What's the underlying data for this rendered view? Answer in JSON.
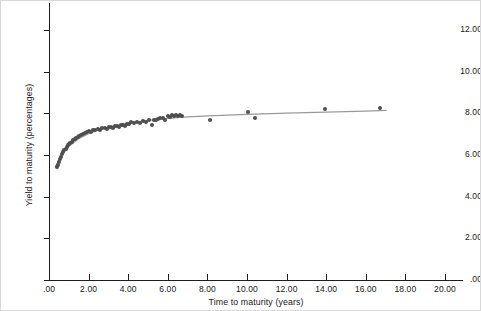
{
  "chart_data": {
    "type": "scatter",
    "title": "",
    "subtitle": "",
    "xlabel": "Time to maturity (years)",
    "ylabel": "Yield to maturity (percentages)",
    "xlim": [
      0,
      21
    ],
    "ylim": [
      0,
      13.3
    ],
    "grid": false,
    "legend": "none",
    "x_ticks": [
      ".00",
      "2.00",
      "4.00",
      "6.00",
      "8.00",
      "10.00",
      "12.00",
      "14.00",
      "16.00",
      "18.00",
      "20.00"
    ],
    "x_tick_values": [
      0,
      2,
      4,
      6,
      8,
      10,
      12,
      14,
      16,
      18,
      20
    ],
    "y_ticks": [
      ".00",
      "2.00",
      "4.00",
      "6.00",
      "8.00",
      "10.00",
      "12.00"
    ],
    "y_tick_values": [
      0,
      2,
      4,
      6,
      8,
      10,
      12
    ],
    "marker_color": "#4e4e4e",
    "line_color": "#9a9a9a",
    "axis_color": "#1d1d1d",
    "background_color": "#ffffff",
    "series": [
      {
        "name": "Observed bonds",
        "type": "scatter",
        "x": [
          0.42,
          0.45,
          0.5,
          0.55,
          0.6,
          0.66,
          0.72,
          0.78,
          0.84,
          0.9,
          0.96,
          1.02,
          1.08,
          1.15,
          1.22,
          1.3,
          1.38,
          1.46,
          1.54,
          1.62,
          1.7,
          1.8,
          1.9,
          2.0,
          2.1,
          2.22,
          2.34,
          2.46,
          2.58,
          2.7,
          2.82,
          2.95,
          3.05,
          3.15,
          3.25,
          3.35,
          3.45,
          3.55,
          3.65,
          3.75,
          3.85,
          3.95,
          4.05,
          4.15,
          4.3,
          4.45,
          4.6,
          4.75,
          4.9,
          5.05,
          5.2,
          5.3,
          5.4,
          5.5,
          5.62,
          5.75,
          5.88,
          6.0,
          6.1,
          6.2,
          6.3,
          6.4,
          6.5,
          6.62,
          6.74,
          8.12,
          10.05,
          10.4,
          13.95,
          16.7
        ],
        "y": [
          5.42,
          5.52,
          5.66,
          5.8,
          5.92,
          6.05,
          6.14,
          6.22,
          6.3,
          6.38,
          6.46,
          6.52,
          6.58,
          6.64,
          6.7,
          6.76,
          6.82,
          6.88,
          6.93,
          6.97,
          7.01,
          7.06,
          7.11,
          7.15,
          7.12,
          7.19,
          7.22,
          7.25,
          7.2,
          7.28,
          7.3,
          7.24,
          7.33,
          7.36,
          7.31,
          7.38,
          7.4,
          7.35,
          7.43,
          7.45,
          7.41,
          7.47,
          7.49,
          7.57,
          7.52,
          7.58,
          7.55,
          7.62,
          7.6,
          7.66,
          7.45,
          7.7,
          7.68,
          7.73,
          7.78,
          7.76,
          7.68,
          7.88,
          7.84,
          7.9,
          7.89,
          7.9,
          7.88,
          7.9,
          7.88,
          7.7,
          8.08,
          7.76,
          8.22,
          8.28
        ]
      },
      {
        "name": "Fitted yield curve",
        "type": "line",
        "x": [
          0.3,
          0.6,
          1.0,
          1.5,
          2.0,
          2.5,
          3.0,
          3.5,
          4.0,
          4.5,
          5.0,
          5.5,
          6.0,
          7.0,
          8.0,
          10.0,
          12.0,
          14.0,
          16.0,
          17.05
        ],
        "y": [
          5.4,
          5.96,
          6.42,
          6.78,
          7.02,
          7.2,
          7.33,
          7.44,
          7.53,
          7.6,
          7.66,
          7.71,
          7.76,
          7.83,
          7.88,
          7.95,
          8.01,
          8.06,
          8.11,
          8.14
        ]
      }
    ]
  },
  "axes": {
    "y_title": "Yield to maturity (percentages)",
    "x_title": "Time to maturity (years)"
  }
}
